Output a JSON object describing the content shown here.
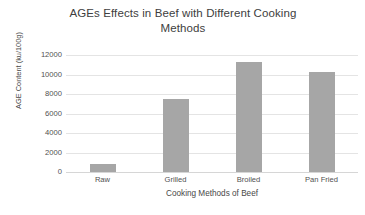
{
  "chart_data": {
    "type": "bar",
    "title": "AGEs Effects in Beef with Different Cooking\nMethods",
    "xlabel": "Cooking Methods of Beef",
    "ylabel": "AGE Content (ku/100g)",
    "categories": [
      "Raw",
      "Grilled",
      "Broiled",
      "Pan Fried"
    ],
    "values": [
      800,
      7500,
      11300,
      10250
    ],
    "series": [
      {
        "name": "AGE Content",
        "values": [
          800,
          7500,
          11300,
          10250
        ]
      }
    ],
    "ylim": [
      0,
      12000
    ],
    "ytick_step": 2000,
    "ytick_labels": [
      "0",
      "2000",
      "4000",
      "6000",
      "8000",
      "10000",
      "12000"
    ],
    "ytick_values": [
      0,
      2000,
      4000,
      6000,
      8000,
      10000,
      12000
    ],
    "grid": true,
    "grid_axis": "y",
    "legend": false,
    "legend_position": "none",
    "bar_color": "#a6a6a6",
    "gridline_color": "#e4e4e4",
    "background_color": "#ffffff",
    "text_color": "#484848"
  }
}
